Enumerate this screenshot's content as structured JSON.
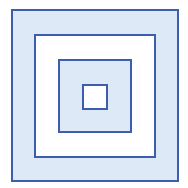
{
  "diagram": {
    "type": "nested-squares",
    "colors": {
      "border": "#3b5fae",
      "fill_light_blue": "#dde9f6",
      "fill_white": "#ffffff"
    },
    "squares": [
      {
        "name": "outer",
        "x": 11,
        "y": 9,
        "w": 168,
        "h": 173,
        "fill": "#dde9f6"
      },
      {
        "name": "second",
        "x": 34,
        "y": 34,
        "w": 122,
        "h": 124,
        "fill": "#ffffff"
      },
      {
        "name": "third",
        "x": 58,
        "y": 59,
        "w": 74,
        "h": 74,
        "fill": "#dde9f6"
      },
      {
        "name": "inner",
        "x": 82,
        "y": 84,
        "w": 26,
        "h": 26,
        "fill": "#ffffff"
      }
    ]
  }
}
